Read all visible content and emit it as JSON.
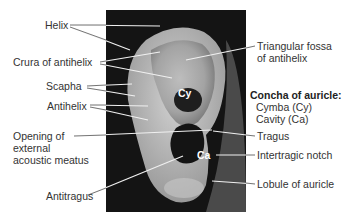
{
  "figure": {
    "photo_alt": "Photograph of external ear (auricle)",
    "left_labels": [
      {
        "id": "helix",
        "text": "Helix"
      },
      {
        "id": "crura",
        "text": "Crura of antihelix"
      },
      {
        "id": "scapha",
        "text": "Scapha"
      },
      {
        "id": "antihelix",
        "text": "Antihelix"
      },
      {
        "id": "opening1",
        "text": "Opening of"
      },
      {
        "id": "opening2",
        "text": "external"
      },
      {
        "id": "opening3",
        "text": "acoustic meatus"
      },
      {
        "id": "antitragus",
        "text": "Antitragus"
      }
    ],
    "right_labels": [
      {
        "id": "fossa1",
        "text": "Triangular fossa"
      },
      {
        "id": "fossa2",
        "text": "of antihelix"
      },
      {
        "id": "concha",
        "text": "Concha of auricle:"
      },
      {
        "id": "cymba",
        "text": "Cymba (Cy)"
      },
      {
        "id": "cavity",
        "text": "Cavity (Ca)"
      },
      {
        "id": "tragus",
        "text": "Tragus"
      },
      {
        "id": "notch",
        "text": "Intertragic notch"
      },
      {
        "id": "lobule",
        "text": "Lobule of auricle"
      }
    ],
    "in_image_tags": {
      "cy": "Cy",
      "ca": "Ca"
    }
  }
}
